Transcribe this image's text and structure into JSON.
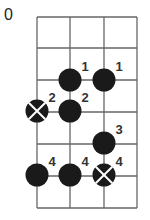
{
  "diagram": {
    "start_fret_label": "0",
    "strings": 4,
    "frets": 6,
    "grid": {
      "x": [
        37,
        70,
        104,
        137
      ],
      "y": [
        17,
        48,
        80,
        112,
        144,
        176,
        208
      ]
    },
    "colors": {
      "line": "#666666",
      "dot": "#1a1a1a",
      "label": "#333333"
    },
    "dots": [
      {
        "string": 2,
        "y": 80,
        "finger": "1",
        "root": false
      },
      {
        "string": 3,
        "y": 80,
        "finger": "1",
        "root": false
      },
      {
        "string": 1,
        "y": 111,
        "finger": "2",
        "root": true
      },
      {
        "string": 2,
        "y": 111,
        "finger": "2",
        "root": false
      },
      {
        "string": 3,
        "y": 143,
        "finger": "3",
        "root": false
      },
      {
        "string": 1,
        "y": 175,
        "finger": "4",
        "root": false
      },
      {
        "string": 2,
        "y": 175,
        "finger": "4",
        "root": false
      },
      {
        "string": 3,
        "y": 175,
        "finger": "4",
        "root": true
      }
    ]
  }
}
